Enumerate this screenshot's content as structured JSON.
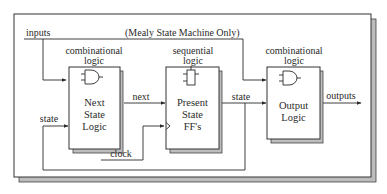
{
  "diagram": {
    "title_note": "(Mealy State Machine Only)",
    "signals": {
      "inputs": "inputs",
      "next": "next",
      "state_left": "state",
      "state_right": "state",
      "clock": "clock",
      "outputs": "outputs"
    },
    "blocks": [
      {
        "id": "next-state-logic",
        "category": [
          "combinational",
          "logic"
        ],
        "icon": "and-gate-icon",
        "label": [
          "Next",
          "State",
          "Logic"
        ]
      },
      {
        "id": "present-state-ffs",
        "category": [
          "sequential",
          "logic"
        ],
        "icon": "flip-flop-icon",
        "label": [
          "Present",
          "State",
          "FF's"
        ]
      },
      {
        "id": "output-logic",
        "category": [
          "combinational",
          "logic"
        ],
        "icon": "and-gate-icon",
        "label": [
          "Output",
          "Logic"
        ]
      }
    ],
    "colors": {
      "line": "#2a2a2a",
      "shadow": "#bdbdbd",
      "frame": "#333333",
      "background": "#ffffff"
    }
  }
}
